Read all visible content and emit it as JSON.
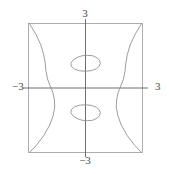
{
  "figure": {
    "title": "",
    "background_color": "#ffffff",
    "frame_color": "#8f8f8f",
    "axis_color": "#5a5a5a",
    "curve_color": "#8a8a8a",
    "label_color": "#4a4a4a",
    "width_px": 169,
    "height_px": 174
  },
  "axes": {
    "x_label_negative": "−3",
    "x_label_positive": "3",
    "y_label_negative": "−3",
    "y_label_positive": "3",
    "x_range": [
      -3,
      3
    ],
    "y_range": [
      -3,
      3
    ],
    "show_frame": true,
    "show_grid": false,
    "axes_cross_at_origin": true
  },
  "chart_data": {
    "type": "line",
    "title": "",
    "xlabel": "",
    "ylabel": "",
    "xlim": [
      -3,
      3
    ],
    "ylim": [
      -3,
      3
    ],
    "grid": false,
    "legend": "none",
    "tick_labels": {
      "x": [
        "−3",
        "3"
      ],
      "y": [
        "−3",
        "3"
      ]
    },
    "series": [
      {
        "name": "upper-oval",
        "kind": "closed-contour",
        "center": [
          0.0,
          1.15
        ],
        "semi_axis_x": 0.78,
        "semi_axis_y": 0.37,
        "points": [
          [
            0.78,
            1.15
          ],
          [
            0.74,
            1.28
          ],
          [
            0.6,
            1.41
          ],
          [
            0.38,
            1.5
          ],
          [
            0.1,
            1.52
          ],
          [
            -0.18,
            1.5
          ],
          [
            -0.44,
            1.42
          ],
          [
            -0.65,
            1.3
          ],
          [
            -0.77,
            1.15
          ],
          [
            -0.74,
            1.0
          ],
          [
            -0.58,
            0.88
          ],
          [
            -0.32,
            0.8
          ],
          [
            0.0,
            0.78
          ],
          [
            0.32,
            0.81
          ],
          [
            0.58,
            0.9
          ],
          [
            0.73,
            1.02
          ],
          [
            0.78,
            1.15
          ]
        ]
      },
      {
        "name": "lower-oval",
        "kind": "closed-contour",
        "center": [
          0.0,
          -1.15
        ],
        "semi_axis_x": 0.78,
        "semi_axis_y": 0.37,
        "points": [
          [
            0.78,
            -1.15
          ],
          [
            0.74,
            -1.28
          ],
          [
            0.6,
            -1.41
          ],
          [
            0.38,
            -1.5
          ],
          [
            0.1,
            -1.52
          ],
          [
            -0.18,
            -1.5
          ],
          [
            -0.44,
            -1.42
          ],
          [
            -0.65,
            -1.3
          ],
          [
            -0.77,
            -1.15
          ],
          [
            -0.74,
            -1.0
          ],
          [
            -0.58,
            -0.88
          ],
          [
            -0.32,
            -0.8
          ],
          [
            0.0,
            -0.78
          ],
          [
            0.32,
            -0.81
          ],
          [
            0.58,
            -0.9
          ],
          [
            0.73,
            -1.02
          ],
          [
            0.78,
            -1.15
          ]
        ]
      },
      {
        "name": "left-wave",
        "kind": "open-contour",
        "points": [
          [
            -2.95,
            3.0
          ],
          [
            -2.6,
            2.48
          ],
          [
            -2.35,
            2.0
          ],
          [
            -2.2,
            1.55
          ],
          [
            -2.12,
            1.15
          ],
          [
            -2.08,
            0.78
          ],
          [
            -2.0,
            0.42
          ],
          [
            -1.86,
            0.1
          ],
          [
            -1.72,
            -0.2
          ],
          [
            -1.64,
            -0.52
          ],
          [
            -1.62,
            -0.88
          ],
          [
            -1.7,
            -1.28
          ],
          [
            -1.88,
            -1.72
          ],
          [
            -2.2,
            -2.22
          ],
          [
            -2.6,
            -2.68
          ],
          [
            -2.95,
            -3.0
          ]
        ]
      },
      {
        "name": "right-wave",
        "kind": "open-contour",
        "points": [
          [
            2.95,
            3.0
          ],
          [
            2.6,
            2.48
          ],
          [
            2.35,
            2.0
          ],
          [
            2.2,
            1.55
          ],
          [
            2.12,
            1.15
          ],
          [
            2.08,
            0.78
          ],
          [
            2.0,
            0.42
          ],
          [
            1.86,
            0.1
          ],
          [
            1.72,
            -0.2
          ],
          [
            1.64,
            -0.52
          ],
          [
            1.62,
            -0.88
          ],
          [
            1.7,
            -1.28
          ],
          [
            1.88,
            -1.72
          ],
          [
            2.2,
            -2.22
          ],
          [
            2.6,
            -2.68
          ],
          [
            2.95,
            -3.0
          ]
        ]
      }
    ]
  }
}
